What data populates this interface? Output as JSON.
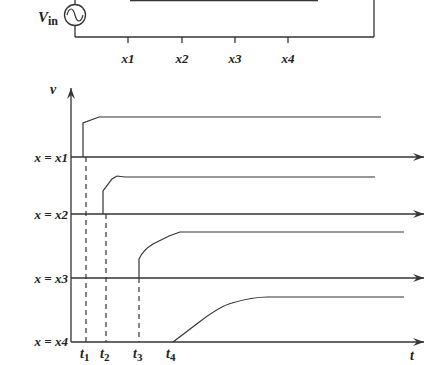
{
  "circuit": {
    "source_label_main": "V",
    "source_label_sub": "in",
    "source_icon": "ac-source-icon",
    "positions": [
      "x1",
      "x2",
      "x3",
      "x4"
    ]
  },
  "plot": {
    "y_axis_label": "v",
    "x_axis_label": "t",
    "rows": [
      {
        "label": "x = x1",
        "time_label_main": "t",
        "time_label_sub": "1"
      },
      {
        "label": "x = x2",
        "time_label_main": "t",
        "time_label_sub": "2"
      },
      {
        "label": "x = x3",
        "time_label_main": "t",
        "time_label_sub": "3"
      },
      {
        "label": "x = x4",
        "time_label_main": "t",
        "time_label_sub": "4"
      }
    ]
  }
}
